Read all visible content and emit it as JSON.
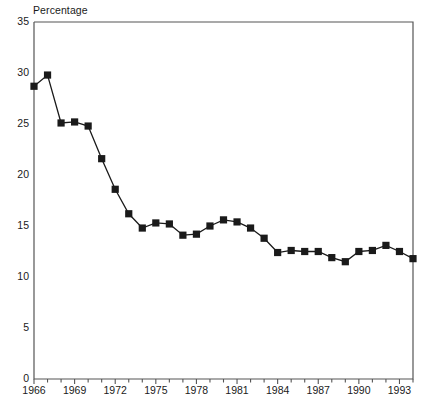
{
  "chart_data": {
    "type": "line",
    "title": "Percentage",
    "xlabel": "",
    "ylabel": "Percentage",
    "ylim": [
      0,
      35
    ],
    "xlim": [
      1966,
      1994
    ],
    "grid": false,
    "legend": null,
    "marker": "filled-square",
    "y_ticks": [
      35,
      30,
      25,
      20,
      15,
      10,
      5,
      0
    ],
    "x_ticks_labeled": [
      1966,
      1969,
      1972,
      1975,
      1978,
      1981,
      1984,
      1987,
      1990,
      1993
    ],
    "x_ticks_minor_step": 1,
    "x": [
      1966,
      1967,
      1968,
      1969,
      1970,
      1971,
      1972,
      1973,
      1974,
      1975,
      1976,
      1977,
      1978,
      1979,
      1980,
      1981,
      1982,
      1983,
      1984,
      1985,
      1986,
      1987,
      1988,
      1989,
      1990,
      1991,
      1992,
      1993,
      1994
    ],
    "values": [
      28.7,
      29.8,
      25.1,
      25.2,
      24.8,
      21.6,
      18.6,
      16.2,
      14.8,
      15.3,
      15.2,
      14.1,
      14.2,
      15.0,
      15.6,
      15.4,
      14.8,
      13.8,
      12.4,
      12.6,
      12.5,
      12.5,
      11.9,
      11.5,
      12.5,
      12.6,
      13.1,
      12.5,
      11.8
    ],
    "series_name": "Percentage",
    "line_color": "#1a1a1a",
    "marker_color": "#1a1a1a",
    "axis_color": "#555555"
  }
}
